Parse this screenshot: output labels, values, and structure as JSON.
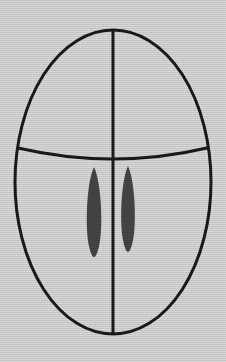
{
  "figure": {
    "title": "Bilateral oval figure with transverse arc and paired lenticular marks",
    "canvas": {
      "width": 226,
      "height": 362
    },
    "background_color": "#d8d8d8",
    "stroke_color": "#1a1a1a",
    "fill_color": "#454545",
    "stroke_width": 3,
    "shapes": {
      "outer_ellipse": {
        "label": "outer-oval-outline",
        "cx": 113,
        "cy": 182,
        "rx": 98,
        "ry": 152,
        "x_extent": [
          15,
          211
        ],
        "y_extent": [
          30,
          334
        ],
        "filled": false
      },
      "vertical_midline": {
        "label": "vertical-midline",
        "x": 113,
        "y_start": 30,
        "y_end": 334
      },
      "transverse_arc": {
        "label": "transverse-arc",
        "x_start": 18,
        "y_start": 148,
        "x_end": 207,
        "y_end": 148,
        "control_x": 113,
        "control_y": 170,
        "lowest_point_y": 162,
        "curvature": "bows-downward"
      },
      "left_lens": {
        "label": "left-lenticular-mark",
        "cx": 94,
        "cy": 212,
        "rx": 9,
        "ry": 45,
        "y_extent": [
          167,
          257
        ],
        "x_extent": [
          85,
          103
        ],
        "filled": true
      },
      "right_lens": {
        "label": "right-lenticular-mark",
        "cx": 128,
        "cy": 209,
        "rx": 8.5,
        "ry": 43,
        "y_extent": [
          166,
          252
        ],
        "x_extent": [
          120,
          137
        ],
        "filled": true
      }
    }
  }
}
